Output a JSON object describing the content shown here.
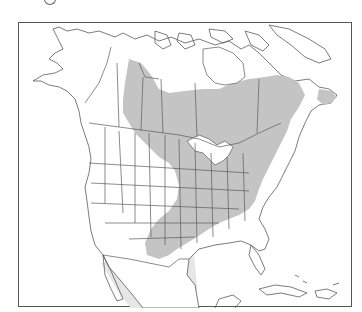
{
  "figure": {
    "type": "range-map",
    "region": "North America",
    "legend": [],
    "shading": {
      "range_color": "#c4c4c4",
      "secondary_range_color": "#e6e6e6",
      "line_color": "#5a5a5a",
      "frame_color": "#555555"
    },
    "shaded_regions": [
      "central-and-eastern-canada-boreal-band",
      "great-lakes-and-eastern-united-states",
      "newfoundland",
      "southern-plains-texas-oklahoma"
    ],
    "light_regions": [
      "northeastern-mexico"
    ]
  }
}
